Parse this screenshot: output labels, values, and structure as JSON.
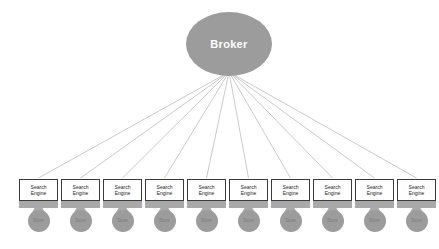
{
  "diagram": {
    "type": "network-topology",
    "background_color": "#ffffff",
    "broker": {
      "label": "Broker",
      "shape": "ellipse",
      "fill_color": "#9c9c9c",
      "text_color": "#ffffff",
      "center_x": 229,
      "center_y": 44,
      "radius_x": 43,
      "radius_y": 32
    },
    "edge_style": {
      "color": "#b3b3b3",
      "width": 0.7,
      "origin_x": 229,
      "origin_y": 72
    },
    "node_style": {
      "screen_fill": "#ffffff",
      "screen_border": "#3b3b3b",
      "base_fill": "#a9a9a9",
      "store_fill": "#9c9c9c",
      "store_text_color": "#7b7b7b",
      "screen_width": 39,
      "screen_height": 22,
      "base_height": 7,
      "store_radius": 11,
      "first_x": 19,
      "spacing": 42,
      "top_y": 179
    },
    "nodes": [
      {
        "line1": "Search",
        "line2": "Engine",
        "store": "Store"
      },
      {
        "line1": "Search",
        "line2": "Engine",
        "store": "Store"
      },
      {
        "line1": "Search",
        "line2": "Engine",
        "store": "Store"
      },
      {
        "line1": "Search",
        "line2": "Engine",
        "store": "Store"
      },
      {
        "line1": "Search",
        "line2": "Engine",
        "store": "Store"
      },
      {
        "line1": "Search",
        "line2": "Engine",
        "store": "Store"
      },
      {
        "line1": "Search",
        "line2": "Engine",
        "store": "Store"
      },
      {
        "line1": "Search",
        "line2": "Engine",
        "store": "Store"
      },
      {
        "line1": "Search",
        "line2": "Engine",
        "store": "Store"
      },
      {
        "line1": "Search",
        "line2": "Engine",
        "store": "Store"
      }
    ]
  }
}
